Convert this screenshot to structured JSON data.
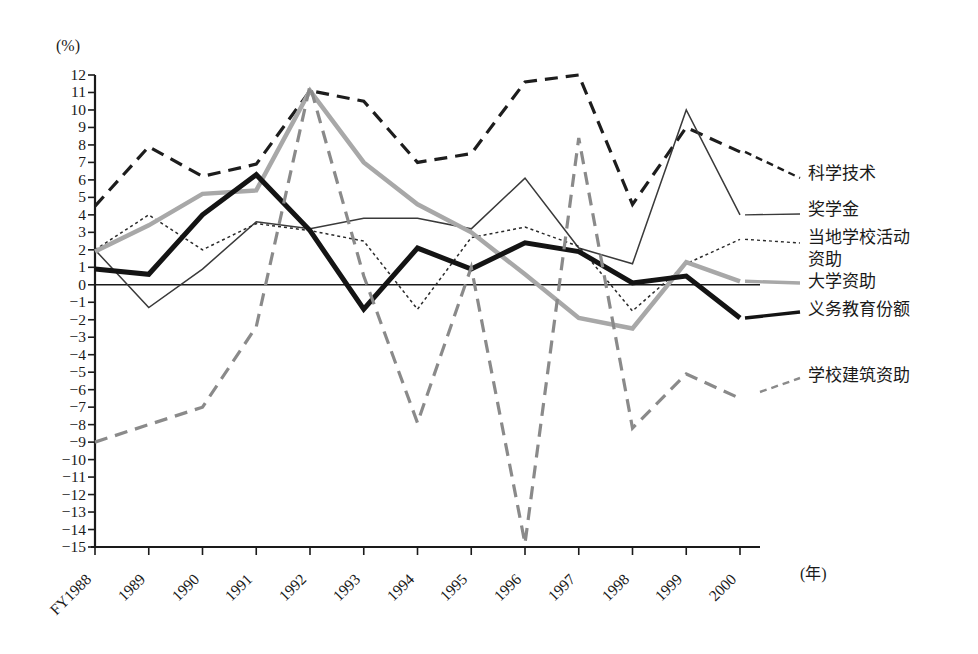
{
  "chart_data": {
    "type": "line",
    "title": "",
    "xlabel": "(年)",
    "ylabel": "(%)",
    "ylim": [
      -15,
      12
    ],
    "grid": false,
    "legend_position": "right-inline",
    "zero_line": true,
    "x": [
      "FY1988",
      "1989",
      "1990",
      "1991",
      "1992",
      "1993",
      "1994",
      "1995",
      "1996",
      "1997",
      "1998",
      "1999",
      "2000"
    ],
    "yticks": [
      "12",
      "11",
      "10",
      "9",
      "8",
      "7",
      "6",
      "5",
      "4",
      "3",
      "2",
      "1",
      "0",
      "-1",
      "-2",
      "-3",
      "-4",
      "-5",
      "-6",
      "-7",
      "-8",
      "-9",
      "-10",
      "-11",
      "-12",
      "-13",
      "-14",
      "-15"
    ],
    "series": [
      {
        "name": "科学技术",
        "style": "dashed",
        "color": "#1d1d1d",
        "width": 3.2,
        "values": [
          4.5,
          7.9,
          6.2,
          6.9,
          11.1,
          10.5,
          7.0,
          7.5,
          11.6,
          12.0,
          4.6,
          9.0,
          7.6
        ]
      },
      {
        "name": "奖学金",
        "style": "solid",
        "color": "#3a3a3a",
        "width": 1.5,
        "values": [
          2.0,
          -1.3,
          0.9,
          3.6,
          3.2,
          3.8,
          3.8,
          3.2,
          6.1,
          2.1,
          1.2,
          10.0,
          4.0
        ]
      },
      {
        "name": "当地学校活动\n资助",
        "style": "dotted",
        "color": "#2a2a2a",
        "width": 1.5,
        "values": [
          2.0,
          4.0,
          2.0,
          3.5,
          3.1,
          2.5,
          -1.4,
          2.7,
          3.3,
          2.2,
          -1.5,
          1.2,
          2.6
        ]
      },
      {
        "name": "大学资助",
        "style": "solid",
        "color": "#a8a8a8",
        "width": 4.5,
        "values": [
          1.9,
          3.4,
          5.2,
          5.4,
          11.1,
          7.0,
          4.6,
          3.0,
          0.6,
          -1.9,
          -2.5,
          1.3,
          0.2
        ]
      },
      {
        "name": "义务教育份额",
        "style": "solid",
        "color": "#141414",
        "width": 5.0,
        "values": [
          0.9,
          0.6,
          4.0,
          6.3,
          3.1,
          -1.4,
          2.1,
          0.9,
          2.4,
          1.9,
          0.1,
          0.5,
          -1.9
        ]
      },
      {
        "name": "学校建筑资助",
        "style": "dashed",
        "color": "#8a8a8a",
        "width": 3.2,
        "values": [
          -9.0,
          -8.0,
          -7.0,
          -2.4,
          11.4,
          0.5,
          -7.9,
          1.0,
          -14.8,
          8.4,
          -8.2,
          -5.1,
          -6.5
        ]
      }
    ]
  },
  "axis": {
    "y_unit": "(%)",
    "x_unit": "(年)"
  },
  "legend_labels": [
    {
      "text": "科学技术"
    },
    {
      "text": "奖学金"
    },
    {
      "text": "当地学校活动"
    },
    {
      "text": "资助"
    },
    {
      "text": "大学资助"
    },
    {
      "text": "义务教育份额"
    },
    {
      "text": "学校建筑资助"
    }
  ]
}
